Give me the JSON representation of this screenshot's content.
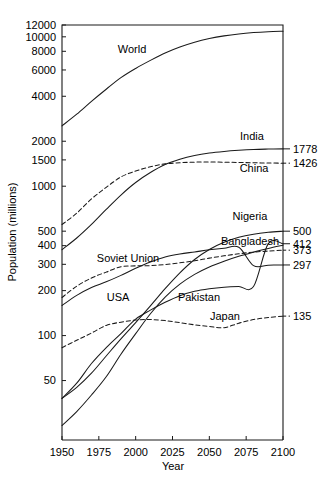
{
  "chart_data": {
    "type": "line",
    "title": "",
    "xlabel": "Year",
    "ylabel": "Population (millions)",
    "xlim": [
      1950,
      2100
    ],
    "ylim": [
      20,
      12000
    ],
    "yscale": "log",
    "grid": false,
    "legend_position": "inline-labels",
    "x_ticks": [
      "1950",
      "1975",
      "2000",
      "2025",
      "2050",
      "2075",
      "2100"
    ],
    "x_tick_values": [
      1950,
      1975,
      2000,
      2025,
      2050,
      2075,
      2100
    ],
    "y_ticks": [
      "12000",
      "10000",
      "8000",
      "6000",
      "4000",
      "2000",
      "1500",
      "1000",
      "500",
      "400",
      "300",
      "200",
      "100",
      "50"
    ],
    "y_tick_values": [
      12000,
      10000,
      8000,
      6000,
      4000,
      2000,
      1500,
      1000,
      500,
      400,
      300,
      200,
      100,
      50
    ],
    "x": [
      1950,
      1960,
      1970,
      1980,
      1990,
      2000,
      2010,
      2020,
      2030,
      2040,
      2050,
      2060,
      2070,
      2080,
      2090,
      2100
    ],
    "series": [
      {
        "name": "World",
        "label": "World",
        "style": "solid",
        "end_value": 10900,
        "end_label": "",
        "values": [
          2536,
          3034,
          3700,
          4458,
          5327,
          6143,
          6957,
          7795,
          8546,
          9198,
          9735,
          10151,
          10459,
          10674,
          10817,
          10900
        ]
      },
      {
        "name": "India",
        "label": "India",
        "style": "solid",
        "end_value": 1778,
        "end_label": "1778",
        "values": [
          376,
          450,
          555,
          699,
          873,
          1059,
          1234,
          1396,
          1515,
          1605,
          1668,
          1710,
          1740,
          1762,
          1772,
          1778
        ]
      },
      {
        "name": "China",
        "label": "China",
        "style": "dashed",
        "end_value": 1426,
        "end_label": "1426",
        "values": [
          554,
          660,
          822,
          982,
          1153,
          1264,
          1348,
          1411,
          1436,
          1449,
          1452,
          1448,
          1442,
          1435,
          1430,
          1426
        ]
      },
      {
        "name": "Nigeria",
        "label": "Nigeria",
        "style": "solid",
        "end_value": 500,
        "end_label": "500",
        "values": [
          38,
          45,
          56,
          73,
          95,
          122,
          158,
          206,
          263,
          323,
          377,
          421,
          455,
          477,
          491,
          500
        ]
      },
      {
        "name": "Bangladesh",
        "label": "Bangladesh",
        "style": "solid",
        "end_value": 412,
        "end_label": "412",
        "values": [
          38,
          48,
          65,
          83,
          103,
          129,
          148,
          167,
          185,
          198,
          206,
          211,
          213,
          213,
          413,
          412
        ]
      },
      {
        "name": "Soviet Union",
        "label": "Soviet Union",
        "style": "dashed",
        "end_value": 373,
        "end_label": "373",
        "values": [
          180,
          214,
          243,
          266,
          289,
          293,
          294,
          299,
          307,
          317,
          330,
          342,
          353,
          362,
          368,
          373
        ]
      },
      {
        "name": "USA",
        "label": "USA",
        "style": "solid",
        "end_value": 297,
        "end_label": "297",
        "values": [
          159,
          186,
          210,
          229,
          253,
          282,
          311,
          336,
          352,
          363,
          375,
          384,
          390,
          294,
          296,
          297
        ]
      },
      {
        "name": "Pakistan",
        "label": "Pakistan",
        "style": "solid",
        "end_value": 403,
        "end_label": "",
        "values": [
          25,
          31,
          40,
          53,
          75,
          103,
          140,
          181,
          221,
          257,
          288,
          315,
          340,
          362,
          383,
          403
        ]
      },
      {
        "name": "Japan",
        "label": "Japan",
        "style": "dashed",
        "end_value": 135,
        "end_label": "135",
        "values": [
          83,
          93,
          104,
          117,
          123,
          127,
          128,
          126,
          122,
          118,
          115,
          113,
          121,
          128,
          132,
          135
        ]
      }
    ],
    "end_labels": [
      "1778",
      "1426",
      "500",
      "412",
      "373",
      "297",
      "135"
    ]
  }
}
